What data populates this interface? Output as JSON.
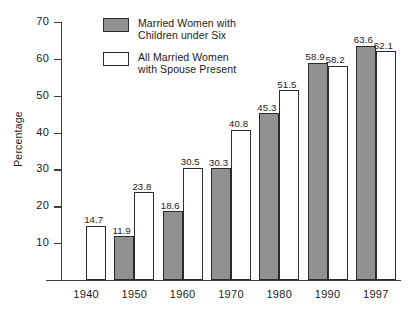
{
  "chart_data": {
    "type": "bar",
    "title": "",
    "xlabel": "",
    "ylabel": "Percentage",
    "ylim": [
      0,
      70
    ],
    "ytick_values": [
      70,
      60,
      50,
      40,
      30,
      20,
      10
    ],
    "ytick_labels": [
      "70",
      "60",
      "50",
      "40",
      "30",
      "20",
      "10"
    ],
    "grid": false,
    "legend_position": "top-center",
    "categories": [
      "1940",
      "1950",
      "1960",
      "1970",
      "1980",
      "1990",
      "1997"
    ],
    "series": [
      {
        "name": "Married Women with Children under Six",
        "style": "filled",
        "color": "#919191",
        "values": [
          null,
          11.9,
          18.6,
          30.3,
          45.3,
          58.9,
          63.6
        ],
        "labels": [
          "",
          "11.9",
          "18.6",
          "30.3",
          "45.3",
          "58.9",
          "63.6"
        ]
      },
      {
        "name": "All Married Women with Spouse Present",
        "style": "hollow",
        "color": "#ffffff",
        "values": [
          14.7,
          23.8,
          30.5,
          40.8,
          51.5,
          58.2,
          62.1
        ],
        "labels": [
          "14.7",
          "23.8",
          "30.5",
          "40.8",
          "51.5",
          "58.2",
          "62.1"
        ]
      }
    ]
  },
  "legend": {
    "entries": [
      {
        "label": "Married Women with\nChildren under Six",
        "style": "filled"
      },
      {
        "label": "All Married Women\nwith Spouse Present",
        "style": "hollow"
      }
    ]
  },
  "colors": {
    "bar_fill": "#919191",
    "bar_outline": "#2b2b2b",
    "axis": "#3d3d3d",
    "background": "#ffffff",
    "text": "#1a1a1a"
  }
}
